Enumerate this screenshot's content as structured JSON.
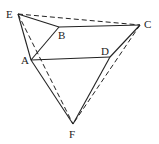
{
  "diagram": {
    "points": {
      "E": {
        "x": 18,
        "y": 14,
        "label": "E",
        "lx": 6,
        "ly": 18
      },
      "B": {
        "x": 59,
        "y": 27,
        "label": "B",
        "lx": 58,
        "ly": 39
      },
      "C": {
        "x": 140,
        "y": 25,
        "label": "C",
        "lx": 144,
        "ly": 28
      },
      "A": {
        "x": 31,
        "y": 60,
        "label": "A",
        "lx": 21,
        "ly": 64
      },
      "D": {
        "x": 110,
        "y": 57,
        "label": "D",
        "lx": 101,
        "ly": 55
      },
      "F": {
        "x": 73,
        "y": 124,
        "label": "F",
        "lx": 69,
        "ly": 138
      }
    },
    "solid_segments": [
      [
        "E",
        "B"
      ],
      [
        "B",
        "C"
      ],
      [
        "E",
        "A"
      ],
      [
        "A",
        "B"
      ],
      [
        "A",
        "D"
      ],
      [
        "D",
        "C"
      ],
      [
        "A",
        "F"
      ],
      [
        "D",
        "F"
      ],
      [
        "E",
        "F"
      ]
    ],
    "dashed_segments": [
      [
        "E",
        "C"
      ],
      [
        "E",
        "F"
      ],
      [
        "C",
        "F"
      ]
    ],
    "stroke_color": "#222222"
  }
}
